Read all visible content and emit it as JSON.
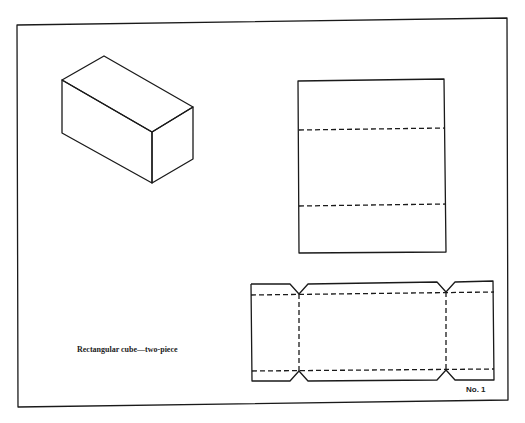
{
  "diagram": {
    "caption": "Rectangular cube—two-piece",
    "plate_number": "No. 1",
    "figures": [
      {
        "name": "isometric-box",
        "type": "isometric rectangular box"
      },
      {
        "name": "lid-pattern",
        "type": "rectangle with two dashed fold lines"
      },
      {
        "name": "body-net",
        "type": "strip net with dashed fold lines and V notches"
      }
    ],
    "colors": {
      "line": "#1a1a1a",
      "background": "#ffffff"
    }
  }
}
